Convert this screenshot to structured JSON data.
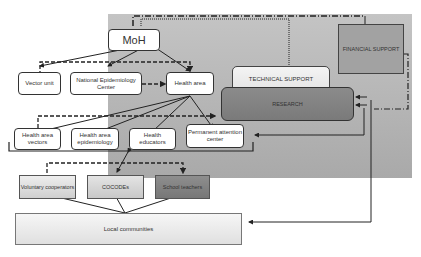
{
  "diagram": {
    "nodes": {
      "moh": "MoH",
      "vector_unit": "Vector unit",
      "national_epi": "National Epidemiology Center",
      "health_area": "Health area",
      "ha_vectors": "Health area vectors",
      "ha_epi": "Health area epidemiology",
      "health_educators": "Health educators",
      "permanent_attention": "Permanent attention center",
      "technical_support": "TECHNICAL SUPPORT",
      "research": "RESEARCH",
      "financial_support": "FINANCIAL SUPPORT",
      "voluntary": "Voluntary cooperators",
      "cocodes": "COCODEs",
      "school_teachers": "School teachers",
      "local_communities": "Local communities"
    },
    "colors": {
      "panel": "#b8b8b8",
      "research": "#828282",
      "financial": "#a2a2a2",
      "school": "#828282",
      "line": "#222222"
    }
  }
}
